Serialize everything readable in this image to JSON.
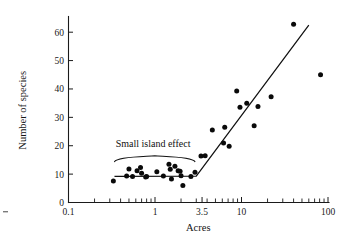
{
  "chart_data": {
    "type": "scatter",
    "title": "",
    "xlabel": "Acres",
    "ylabel": "Number of species",
    "xscale": "log",
    "yscale": "linear",
    "xlim": [
      0.1,
      100
    ],
    "ylim": [
      0,
      65
    ],
    "grid": false,
    "legend": null,
    "x_tick_labels": [
      "0.1",
      "1",
      "3.5",
      "10",
      "100"
    ],
    "x_tick_values": [
      0.1,
      1,
      3.5,
      10,
      100
    ],
    "x_minor_tick_values": [
      0.2,
      0.3,
      0.4,
      0.5,
      0.6,
      0.7,
      0.8,
      0.9,
      2,
      3,
      4,
      5,
      6,
      7,
      8,
      9,
      20,
      30,
      40,
      50,
      60,
      70,
      80,
      90
    ],
    "y_tick_labels": [
      "0",
      "10",
      "20",
      "30",
      "40",
      "50",
      "60"
    ],
    "y_tick_values": [
      0,
      10,
      20,
      30,
      40,
      50,
      60
    ],
    "annotations": [
      {
        "text": "Small island effect",
        "x": 0.95,
        "y": 19.5,
        "brace_x_start": 0.34,
        "brace_x_end": 2.9
      }
    ],
    "series": [
      {
        "name": "islands",
        "type": "scatter",
        "marker": "filled-circle",
        "color": "#0a0a0a",
        "points": [
          [
            0.33,
            7.6
          ],
          [
            0.47,
            9.3
          ],
          [
            0.5,
            11.8
          ],
          [
            0.55,
            9.2
          ],
          [
            0.62,
            11.2
          ],
          [
            0.68,
            12.3
          ],
          [
            0.7,
            10.3
          ],
          [
            0.78,
            9.0
          ],
          [
            0.8,
            9.2
          ],
          [
            1.05,
            10.8
          ],
          [
            1.25,
            9.3
          ],
          [
            1.45,
            13.5
          ],
          [
            1.5,
            11.7
          ],
          [
            1.55,
            8.3
          ],
          [
            1.7,
            12.8
          ],
          [
            1.85,
            11.2
          ],
          [
            1.95,
            11.0
          ],
          [
            2.0,
            9.4
          ],
          [
            2.1,
            6.0
          ],
          [
            2.6,
            9.2
          ],
          [
            2.9,
            10.7
          ],
          [
            3.4,
            16.4
          ],
          [
            3.8,
            16.5
          ],
          [
            4.6,
            25.5
          ],
          [
            6.2,
            21.0
          ],
          [
            6.4,
            26.5
          ],
          [
            7.2,
            19.8
          ],
          [
            8.8,
            39.3
          ],
          [
            9.6,
            33.6
          ],
          [
            11.5,
            35.0
          ],
          [
            14.0,
            27.0
          ],
          [
            15.5,
            33.8
          ],
          [
            22.0,
            37.3
          ],
          [
            40.0,
            62.8
          ],
          [
            82.0,
            45.0
          ]
        ]
      },
      {
        "name": "piecewise-fit",
        "type": "line",
        "color": "#111111",
        "points": [
          [
            0.34,
            9.2
          ],
          [
            3.0,
            9.3
          ],
          [
            60.0,
            62.5
          ]
        ]
      }
    ]
  },
  "figure": {
    "background_color": "#ffffff",
    "foreground_color": "#111111"
  }
}
